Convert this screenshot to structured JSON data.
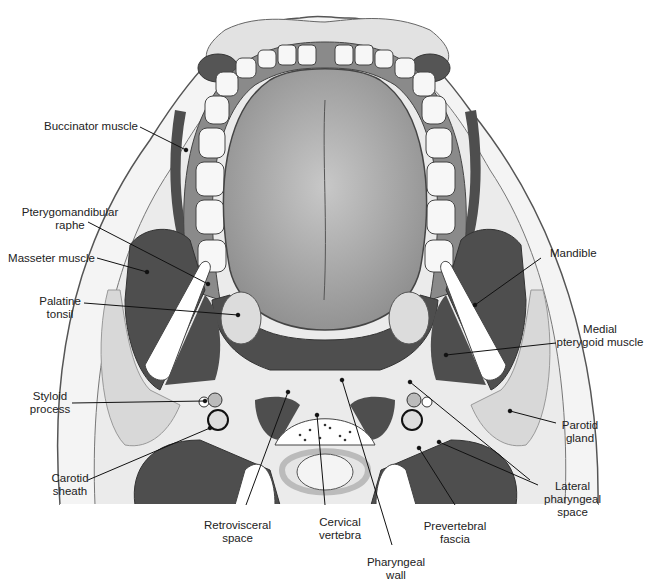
{
  "figure": {
    "colors": {
      "skin_outline": "#555555",
      "skin_fill": "#f4f4f4",
      "subcutaneous": "#e6e6e6",
      "muscle": "#4e4e4e",
      "tongue": "#9a9a9a",
      "tooth": "#f7f7f7",
      "gingiva": "#8a8a8a",
      "bone": "#ffffff",
      "gland": "#d8d8d8",
      "leader_line": "#111111"
    }
  },
  "labels": {
    "buccinator": "Buccinator muscle",
    "pterygomandibular_1": "Pterygomandibular",
    "pterygomandibular_2": "raphe",
    "masseter": "Masseter muscle",
    "palatine_1": "Palatine",
    "palatine_2": "tonsil",
    "styloid_1": "Styloid",
    "styloid_2": "process",
    "carotid_1": "Carotid",
    "carotid_2": "sheath",
    "retrovisceral_1": "Retrovisceral",
    "retrovisceral_2": "space",
    "cervical_1": "Cervical",
    "cervical_2": "vertebra",
    "pharyngeal_1": "Pharyngeal",
    "pharyngeal_2": "wall",
    "prevertebral_1": "Prevertebral",
    "prevertebral_2": "fascia",
    "lateral_1": "Lateral",
    "lateral_2": "pharyngeal",
    "lateral_3": "space",
    "parotid_1": "Parotid",
    "parotid_2": "gland",
    "medial_1": "Medial",
    "medial_2": "pterygoid muscle",
    "mandible": "Mandible"
  }
}
